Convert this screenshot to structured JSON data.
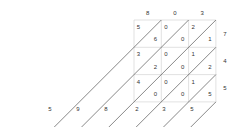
{
  "diagram": {
    "type": "lattice-multiplication",
    "multiplicand_digits": [
      "8",
      "0",
      "3"
    ],
    "multiplier_digits": [
      "7",
      "4",
      "5"
    ],
    "cells": [
      [
        {
          "tens": "5",
          "ones": "6"
        },
        {
          "tens": "0",
          "ones": "0"
        },
        {
          "tens": "2",
          "ones": "1"
        }
      ],
      [
        {
          "tens": "3",
          "ones": "2"
        },
        {
          "tens": "0",
          "ones": "0"
        },
        {
          "tens": "1",
          "ones": "2"
        }
      ],
      [
        {
          "tens": "4",
          "ones": "0"
        },
        {
          "tens": "0",
          "ones": "0"
        },
        {
          "tens": "1",
          "ones": "5"
        }
      ]
    ],
    "result_digits": [
      "5",
      "9",
      "8",
      "2",
      "3",
      "5"
    ],
    "colors": {
      "grid": "#cccccc",
      "diagonal": "#555555",
      "text": "#333333"
    }
  }
}
